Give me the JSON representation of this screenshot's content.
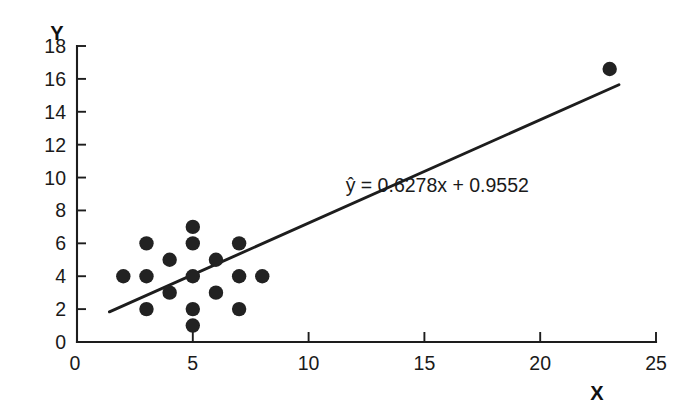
{
  "chart_data": {
    "type": "scatter",
    "title": "",
    "xlabel": "X",
    "ylabel": "Y",
    "xlim": [
      0,
      25
    ],
    "ylim": [
      0,
      18
    ],
    "xticks": [
      0,
      5,
      10,
      15,
      20,
      25
    ],
    "yticks": [
      0,
      2,
      4,
      6,
      8,
      10,
      12,
      14,
      16,
      18
    ],
    "xtick_labels": [
      "0",
      "5",
      "10",
      "15",
      "20",
      "25"
    ],
    "ytick_labels": [
      "0",
      "2",
      "4",
      "6",
      "8",
      "10",
      "12",
      "14",
      "16",
      "18"
    ],
    "grid": false,
    "legend": null,
    "points": [
      {
        "x": 2,
        "y": 4
      },
      {
        "x": 3,
        "y": 6
      },
      {
        "x": 3,
        "y": 4
      },
      {
        "x": 3,
        "y": 2
      },
      {
        "x": 4,
        "y": 5
      },
      {
        "x": 4,
        "y": 3
      },
      {
        "x": 5,
        "y": 7
      },
      {
        "x": 5,
        "y": 6
      },
      {
        "x": 5,
        "y": 4
      },
      {
        "x": 5,
        "y": 2
      },
      {
        "x": 5,
        "y": 1
      },
      {
        "x": 6,
        "y": 5
      },
      {
        "x": 6,
        "y": 3
      },
      {
        "x": 7,
        "y": 6
      },
      {
        "x": 7,
        "y": 4
      },
      {
        "x": 7,
        "y": 2
      },
      {
        "x": 8,
        "y": 4
      },
      {
        "x": 23,
        "y": 16.6
      }
    ],
    "fit_line": {
      "slope": 0.6278,
      "intercept": 0.9552,
      "x_start": 1.4,
      "x_end": 23.4
    },
    "annotations": [
      {
        "name": "regression-equation",
        "text": "ŷ = 0.6278x + 0.9552",
        "x": 11.6,
        "y": 9.1
      }
    ]
  },
  "axis_titles": {
    "y": "Y",
    "x": "X"
  },
  "colors": {
    "point": "#222222",
    "line": "#1d1d1d",
    "axis": "#1d1d1d",
    "text": "#1a1a1a",
    "background": "#ffffff"
  }
}
